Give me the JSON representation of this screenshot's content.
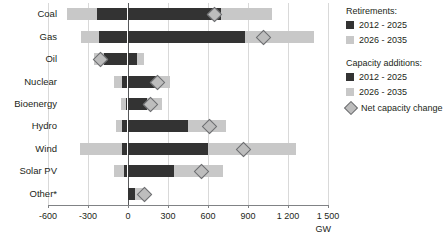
{
  "chart_data": {
    "type": "bar",
    "title": "",
    "xlabel": "GW",
    "ylabel": "",
    "xlim": [
      -600,
      1500
    ],
    "xticks": [
      -600,
      -300,
      0,
      300,
      600,
      900,
      1200,
      1500
    ],
    "xticklabels": [
      "-600",
      "-300",
      "0",
      "300",
      "600",
      "900",
      "1 200",
      "1 500"
    ],
    "grid": true,
    "orientation": "horizontal",
    "categories": [
      "Coal",
      "Gas",
      "Oil",
      "Nuclear",
      "Bioenergy",
      "Hydro",
      "Wind",
      "Solar PV",
      "Other*"
    ],
    "series": [
      {
        "name": "Retirements: 2012 - 2025",
        "color": "#333333",
        "values": [
          -226,
          -212,
          -176,
          -40,
          -10,
          -40,
          -40,
          -25,
          0
        ]
      },
      {
        "name": "Retirements: 2026 - 2035",
        "color": "#c8c8c8",
        "values": [
          -229,
          -136,
          -79,
          -65,
          -36,
          -43,
          -315,
          -79,
          0
        ]
      },
      {
        "name": "Capacity additions: 2012 - 2025",
        "color": "#333333",
        "values": [
          700,
          880,
          70,
          220,
          145,
          450,
          600,
          345,
          55
        ]
      },
      {
        "name": "Capacity additions: 2026 - 2035",
        "color": "#c8c8c8",
        "values": [
          380,
          515,
          50,
          100,
          110,
          285,
          660,
          365,
          75
        ]
      }
    ],
    "net_capacity_change": {
      "name": "Net capacity change",
      "values": [
        650,
        1015,
        -205,
        220,
        165,
        610,
        865,
        550,
        125
      ]
    }
  },
  "axis": {
    "unit": "GW",
    "tick_labels": [
      "-600",
      "-300",
      "0",
      "300",
      "600",
      "900",
      "1 200",
      "1 500"
    ]
  },
  "categories": {
    "coal": "Coal",
    "gas": "Gas",
    "oil": "Oil",
    "nuclear": "Nuclear",
    "bioenergy": "Bioenergy",
    "hydro": "Hydro",
    "wind": "Wind",
    "solar_pv": "Solar PV",
    "other": "Other*"
  },
  "legend": {
    "retirements_title": "Retirements:",
    "retirements_items": [
      "2012 - 2025",
      "2026 - 2035"
    ],
    "additions_title": "Capacity additions:",
    "additions_items": [
      "2012 - 2025",
      "2026 - 2035"
    ],
    "net_label": "Net capacity change",
    "colors": {
      "dark": "#333333",
      "light": "#c8c8c8",
      "diamond": "#bdbdbd"
    }
  }
}
